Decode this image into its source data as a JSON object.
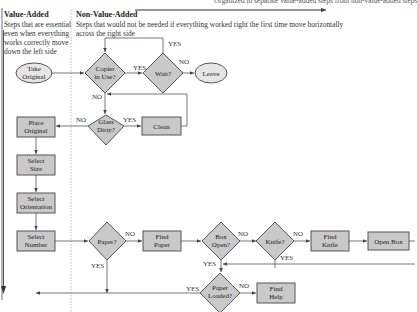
{
  "top_caption": "Organized to separate value-added steps from non-value-added steps",
  "value_added": {
    "title": "Value-Added",
    "description": [
      "Steps that are essential",
      "even when everything",
      "works correctly move",
      "down the left side"
    ]
  },
  "non_value_added": {
    "title": "Non-Value-Added",
    "description": [
      "Steps that would not be needed if everything worked right the first time move horizontally",
      "across the right side"
    ]
  },
  "nodes": {
    "take_original": "Take|Original",
    "copier_in_use": "Copier|in Use?",
    "wait": "Wait?",
    "leave": "Leave",
    "glass_dirty": "Glass|Dirty?",
    "clean": "Clean",
    "place_original": "Place|Original",
    "select_size": "Select|Size",
    "select_orientation": "Select|Orientation",
    "select_number": "Select|Number",
    "paper": "Paper?",
    "find_paper": "Find|Paper",
    "box_open": "Box|Open?",
    "knife": "Knife?",
    "find_knife": "Find|Knife",
    "open_box": "Open Box",
    "paper_loaded": "Paper|Loaded?",
    "find_help": "Find|Help"
  },
  "edge_labels": {
    "yes": "YES",
    "no": "NO"
  },
  "colors": {
    "shape_fill": "#cfcfcf",
    "oval_fill": "#e6e6e6",
    "stroke": "#555555",
    "divider": "#aaaaaa"
  }
}
